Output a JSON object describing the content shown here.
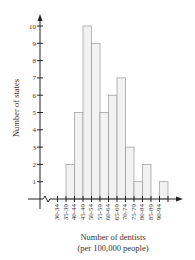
{
  "chart_data": {
    "type": "bar",
    "title": "",
    "xlabel": "Number of dentists",
    "xlabel_sub": "(per 100,000 people)",
    "ylabel": "Number of states",
    "categories": [
      "30-34",
      "35-39",
      "40-44",
      "45-49",
      "50-54",
      "55-59",
      "60-64",
      "65-69",
      "70-74",
      "75-79",
      "80-84",
      "85-89",
      "90-94"
    ],
    "values": [
      0,
      2,
      5,
      10,
      9,
      5,
      6,
      7,
      3,
      1,
      2,
      0,
      1
    ],
    "ylim": [
      0,
      10
    ],
    "yticks": [
      1,
      2,
      3,
      4,
      5,
      6,
      7,
      8,
      9,
      10
    ],
    "grid": false,
    "axis_break": true,
    "bar_fill": "#f2f2f2",
    "bar_stroke": "#999999"
  }
}
